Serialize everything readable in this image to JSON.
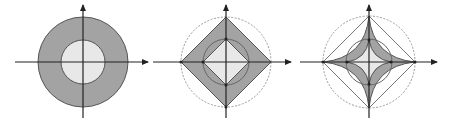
{
  "colors": {
    "background": "#ffffff",
    "dark_fill": "#a3a3a3",
    "light_fill": "#e8e8e8",
    "stroke": "#555555",
    "axis": "#222222",
    "dashed_circle": "#9a9a9a"
  },
  "panels": [
    {
      "id": "panel-1",
      "description": "Annulus: outer gray disk with light inner disk, centered on coordinate axes",
      "center": [
        83,
        62
      ],
      "outer_radius": 45,
      "inner_radius": 22
    },
    {
      "id": "panel-2",
      "description": "Large gray diamond between a dashed outer circle and an inner circle, with a light inner diamond",
      "center": [
        226,
        62
      ],
      "outer_radius": 45,
      "inner_radius": 23
    },
    {
      "id": "panel-3",
      "description": "Astroid-like concave star (gray) inscribed in dashed outer circle and square, with inner circle and light inner concave region",
      "center": [
        369,
        62
      ],
      "outer_radius": 46,
      "inner_radius": 21
    }
  ]
}
